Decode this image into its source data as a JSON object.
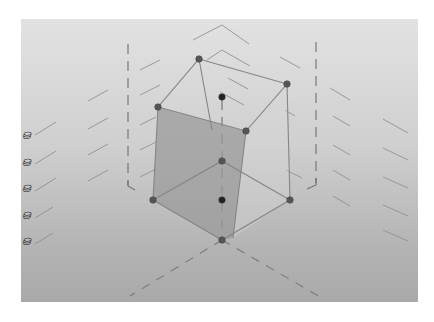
{
  "view": {
    "type": "3d-graphics-view",
    "panel_gradient": [
      "#e2e2e2",
      "#a9a9a9"
    ],
    "line_color": "#7a7a7a",
    "edge_color": "#8a8a8a",
    "point_color": "#555555",
    "shaded_face_color": "#9a9a9a"
  },
  "left_toolbar": {
    "icons": [
      {
        "name": "object-icon-1",
        "glyph": "⛁"
      },
      {
        "name": "object-icon-2",
        "glyph": "⛁"
      },
      {
        "name": "object-icon-3",
        "glyph": "⛁"
      },
      {
        "name": "object-icon-4",
        "glyph": "⛁"
      },
      {
        "name": "object-icon-5",
        "glyph": "⛁"
      }
    ]
  },
  "diagram": {
    "points": [
      {
        "id": "A",
        "x": 199,
        "y": 59
      },
      {
        "id": "B",
        "x": 287,
        "y": 84
      },
      {
        "id": "C",
        "x": 246,
        "y": 131
      },
      {
        "id": "D",
        "x": 158,
        "y": 107
      },
      {
        "id": "E",
        "x": 153,
        "y": 200
      },
      {
        "id": "F",
        "x": 222,
        "y": 161
      },
      {
        "id": "G",
        "x": 290,
        "y": 200
      },
      {
        "id": "H",
        "x": 222,
        "y": 240
      },
      {
        "id": "P1",
        "x": 222,
        "y": 97
      },
      {
        "id": "P2",
        "x": 222,
        "y": 200
      }
    ]
  },
  "caption": ""
}
